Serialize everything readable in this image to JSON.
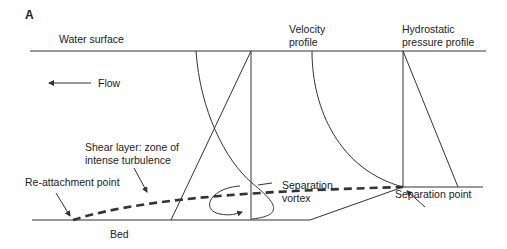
{
  "panel_label": "A",
  "labels": {
    "water_surface": "Water surface",
    "flow": "Flow",
    "velocity_profile_line1": "Velocity",
    "velocity_profile_line2": "profile",
    "hydrostatic_line1": "Hydrostatic",
    "hydrostatic_line2": "pressure profile",
    "shear_layer_line1": "Shear layer: zone of",
    "shear_layer_line2": "intense turbulence",
    "reattachment_point": "Re-attachment point",
    "separation_vortex_line1": "Separation",
    "separation_vortex_line2": "vortex",
    "separation_point": "Separation point",
    "bed": "Bed"
  },
  "colors": {
    "line": "#333333",
    "text": "#222222",
    "background": "#ffffff"
  }
}
